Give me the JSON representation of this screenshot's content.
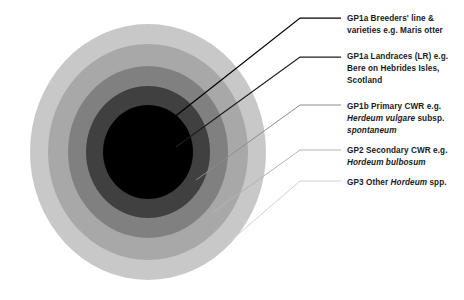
{
  "diagram": {
    "background_color": "#ffffff",
    "center": {
      "x": 148,
      "y": 152
    },
    "rings": [
      {
        "name": "GP3 Other Hordeum spp.",
        "ring_index": 4,
        "color": "#c8c8c8",
        "radius_x": 118,
        "radius_y": 128,
        "leader_color": "#d2d2d2"
      },
      {
        "name": "GP2 Secondary CWR",
        "ring_index": 3,
        "color": "#a8a8a8",
        "radius_x": 100,
        "radius_y": 108,
        "leader_color": "#b4b4b4"
      },
      {
        "name": "GP1b Primary CWR",
        "ring_index": 2,
        "color": "#808080",
        "radius_x": 80,
        "radius_y": 86,
        "leader_color": "#8c8c8c"
      },
      {
        "name": "GP1a Landraces",
        "ring_index": 1,
        "color": "#404040",
        "radius_x": 62,
        "radius_y": 66,
        "leader_color": "#2a2a2a"
      },
      {
        "name": "GP1a Breeders' line & varieties",
        "ring_index": 0,
        "color": "#000000",
        "radius_x": 45,
        "radius_y": 47,
        "leader_color": "#000000"
      }
    ],
    "leaders": [
      {
        "name": "leader-gp1a-breeders",
        "x1": 168,
        "y1": 122,
        "x2": 300,
        "y2": 18,
        "x3": 341,
        "y3": 18,
        "color": "#000000",
        "width": 1.25
      },
      {
        "name": "leader-gp1a-landraces",
        "x1": 176,
        "y1": 147,
        "x2": 300,
        "y2": 57,
        "x3": 341,
        "y3": 57,
        "color": "#1c1c1c",
        "width": 1.25
      },
      {
        "name": "leader-gp1b-primary",
        "x1": 196,
        "y1": 180,
        "x2": 300,
        "y2": 105,
        "x3": 341,
        "y3": 105,
        "color": "#8c8c8c",
        "width": 1.0
      },
      {
        "name": "leader-gp2-secondary",
        "x1": 212,
        "y1": 213,
        "x2": 300,
        "y2": 150,
        "x3": 341,
        "y3": 150,
        "color": "#b4b4b4",
        "width": 1.0
      },
      {
        "name": "leader-gp3-other",
        "x1": 228,
        "y1": 243,
        "x2": 300,
        "y2": 181,
        "x3": 341,
        "y3": 181,
        "color": "#d2d2d2",
        "width": 1.0
      }
    ],
    "labels": [
      {
        "id": "gp1a-breeders",
        "lines": [
          [
            {
              "t": "GP1a Breeders' line &",
              "i": false
            }
          ],
          [
            {
              "t": "varieties e.g. Maris otter",
              "i": false
            }
          ]
        ]
      },
      {
        "id": "gp1a-landraces",
        "lines": [
          [
            {
              "t": "GP1a Landraces (LR) e.g.",
              "i": false
            }
          ],
          [
            {
              "t": "Bere on Hebrides Isles,",
              "i": false
            }
          ],
          [
            {
              "t": "Scotland",
              "i": false
            }
          ]
        ]
      },
      {
        "id": "gp1b-primary-cwr",
        "lines": [
          [
            {
              "t": "GP1b Primary CWR e.g.",
              "i": false
            }
          ],
          [
            {
              "t": "Herdeum vulgare",
              "i": true
            },
            {
              "t": " subsp.",
              "i": false
            }
          ],
          [
            {
              "t": "spontaneum",
              "i": true
            }
          ]
        ]
      },
      {
        "id": "gp2-secondary-cwr",
        "lines": [
          [
            {
              "t": "GP2 Secondary CWR e.g.",
              "i": false
            }
          ],
          [
            {
              "t": "Hordeum bulbosum",
              "i": true
            }
          ]
        ]
      },
      {
        "id": "gp3-other-hordeum",
        "lines": [
          [
            {
              "t": "GP3 Other ",
              "i": false
            },
            {
              "t": "Hordeum",
              "i": true
            },
            {
              "t": " spp.",
              "i": false
            }
          ]
        ]
      }
    ]
  }
}
